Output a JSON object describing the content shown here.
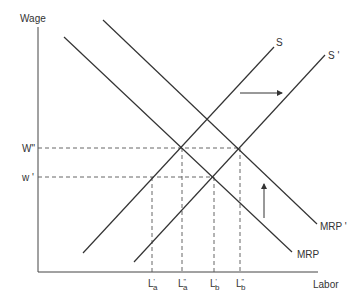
{
  "axes": {
    "y_label": "Wage",
    "x_label": "Labor",
    "y_ticks": [
      {
        "label": "W\"",
        "y": 148
      },
      {
        "label": "w '",
        "y": 177
      }
    ],
    "x_ticks": [
      {
        "label": "L",
        "sub": "a",
        "prime": "'",
        "x": 152
      },
      {
        "label": "L",
        "sub": "a",
        "prime": "\"",
        "x": 182
      },
      {
        "label": "L",
        "sub": "b",
        "prime": "'",
        "x": 214
      },
      {
        "label": "L",
        "sub": "b",
        "prime": "\"",
        "x": 240
      }
    ]
  },
  "curves": [
    {
      "name": "S",
      "label": "S",
      "type": "supply"
    },
    {
      "name": "S'",
      "label": "S '",
      "type": "supply-shifted"
    },
    {
      "name": "MRP",
      "label": "MRP",
      "type": "demand"
    },
    {
      "name": "MRP'",
      "label": "MRP '",
      "type": "demand-shifted"
    }
  ],
  "arrows": [
    {
      "name": "supply-shift-arrow",
      "direction": "right"
    },
    {
      "name": "demand-shift-arrow",
      "direction": "up"
    }
  ],
  "colors": {
    "line": "#333333",
    "dashed": "#555555"
  }
}
